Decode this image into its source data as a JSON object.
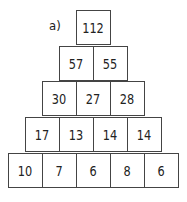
{
  "label": "a)",
  "pyramid": {
    "rows": [
      [
        "112"
      ],
      [
        "57",
        "55"
      ],
      [
        "30",
        "27",
        "28"
      ],
      [
        "17",
        "13",
        "14",
        "14"
      ],
      [
        "10",
        "7",
        "6",
        "8",
        "6"
      ]
    ]
  }
}
